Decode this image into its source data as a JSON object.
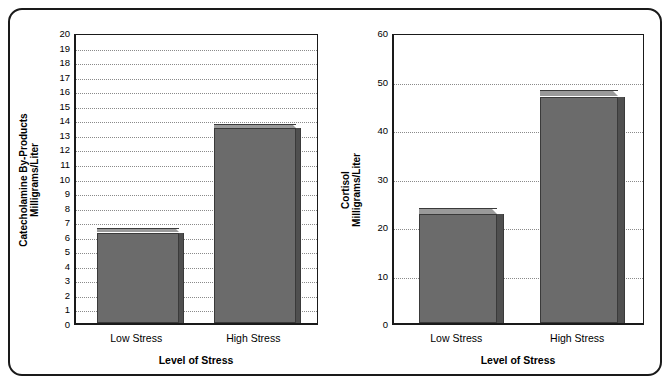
{
  "figure": {
    "border_color": "#1a1a1a",
    "background": "#ffffff"
  },
  "chart_data": [
    {
      "type": "bar",
      "panel": "left",
      "title": "",
      "categories": [
        "Low Stress",
        "High Stress"
      ],
      "values": [
        6.2,
        13.4
      ],
      "bar_top_values": [
        6.5,
        13.7
      ],
      "xlabel": "Level of Stress",
      "ylabel_line1": "Catecholamine By-Products",
      "ylabel_line2": "Milligrams/Liter",
      "ylim": [
        0,
        20
      ],
      "ytick_step": 1,
      "yticks": [
        "0",
        "1",
        "2",
        "3",
        "4",
        "5",
        "6",
        "7",
        "8",
        "9",
        "10",
        "11",
        "12",
        "13",
        "14",
        "15",
        "16",
        "17",
        "18",
        "19",
        "20"
      ],
      "grid": true,
      "legend": "none",
      "bar_face_color": "#6b6b6b",
      "bar_top_color": "#9a9a9a",
      "bar_side_color": "#4f4f4f"
    },
    {
      "type": "bar",
      "panel": "right",
      "title": "",
      "categories": [
        "Low Stress",
        "High Stress"
      ],
      "values": [
        22.5,
        46.6
      ],
      "bar_top_values": [
        23.8,
        48.0
      ],
      "xlabel": "Level of Stress",
      "ylabel_line1": "Cortisol",
      "ylabel_line2": "Milligrams/Liter",
      "ylim": [
        0,
        60
      ],
      "ytick_step": 10,
      "yticks": [
        "0",
        "10",
        "20",
        "30",
        "40",
        "50",
        "60"
      ],
      "grid": true,
      "legend": "none",
      "bar_face_color": "#6b6b6b",
      "bar_top_color": "#9a9a9a",
      "bar_side_color": "#4f4f4f"
    }
  ],
  "left_chart": {
    "ytitle_line1": "Catecholamine By-Products",
    "ytitle_line2": "Milligrams/Liter",
    "xtitle": "Level of Stress",
    "cat1": "Low Stress",
    "cat2": "High Stress"
  },
  "right_chart": {
    "ytitle_line1": "Cortisol",
    "ytitle_line2": "Milligrams/Liter",
    "xtitle": "Level of Stress",
    "cat1": "Low Stress",
    "cat2": "High Stress"
  }
}
